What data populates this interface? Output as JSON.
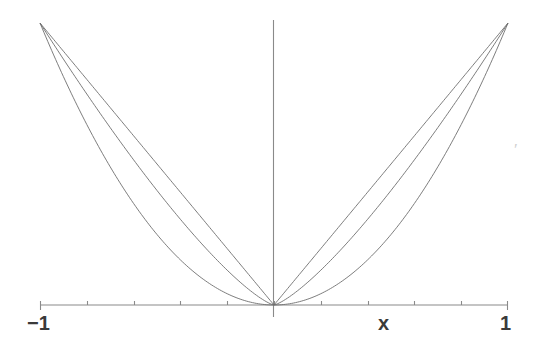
{
  "figure": {
    "background_color": "#ffffff",
    "axis_color": "#8a8a8a",
    "curve_color": "#6e6e6e",
    "label_color": "#3a3a3a",
    "labels": {
      "x_min": "−1",
      "x_max": "1",
      "x_axis_name": "x"
    },
    "artifact": {
      "mark": "′",
      "color": "#cfcfcf"
    }
  },
  "chart_data": {
    "type": "line",
    "title": "",
    "xlabel": "x",
    "ylabel": "",
    "xlim": [
      -1,
      1
    ],
    "ylim": [
      0,
      1
    ],
    "grid": false,
    "legend": "none",
    "xticks": [
      -1,
      -0.8,
      -0.6,
      -0.4,
      -0.2,
      0,
      0.2,
      0.4,
      0.6,
      0.8,
      1
    ],
    "xtick_labels": [
      "−1",
      "",
      "",
      "",
      "",
      "",
      "",
      "",
      "",
      "",
      "1"
    ],
    "x": [
      -1,
      -0.9,
      -0.8,
      -0.7,
      -0.6,
      -0.5,
      -0.4,
      -0.3,
      -0.2,
      -0.1,
      0,
      0.1,
      0.2,
      0.3,
      0.4,
      0.5,
      0.6,
      0.7,
      0.8,
      0.9,
      1
    ],
    "series": [
      {
        "name": "|x|",
        "exponent": 1,
        "values": [
          1,
          0.9,
          0.8,
          0.7,
          0.6,
          0.5,
          0.4,
          0.3,
          0.2,
          0.1,
          0,
          0.1,
          0.2,
          0.3,
          0.4,
          0.5,
          0.6,
          0.7,
          0.8,
          0.9,
          1
        ]
      },
      {
        "name": "|x|^1.3",
        "exponent": 1.3,
        "values": [
          1,
          0.872,
          0.747,
          0.625,
          0.507,
          0.406,
          0.308,
          0.214,
          0.125,
          0.05,
          0,
          0.05,
          0.125,
          0.214,
          0.308,
          0.406,
          0.507,
          0.625,
          0.747,
          0.872,
          1
        ]
      },
      {
        "name": "|x|^2",
        "exponent": 2,
        "values": [
          1,
          0.81,
          0.64,
          0.49,
          0.36,
          0.25,
          0.16,
          0.09,
          0.04,
          0.01,
          0,
          0.01,
          0.04,
          0.09,
          0.16,
          0.25,
          0.36,
          0.49,
          0.64,
          0.81,
          1
        ]
      }
    ]
  }
}
